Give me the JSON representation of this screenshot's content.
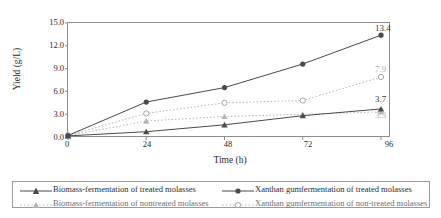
{
  "chart_data": {
    "type": "line",
    "title": "",
    "xlabel": "Time (h)",
    "ylabel": "Yield (g/L)",
    "x": [
      0,
      24,
      48,
      72,
      96
    ],
    "xticklabels": [
      "0",
      "24",
      "48",
      "72",
      "96"
    ],
    "yticklabels": [
      "0.0",
      "3.0",
      "6.0",
      "9.0",
      "12.0",
      "15.0"
    ],
    "ytickvalues": [
      0.0,
      3.0,
      6.0,
      9.0,
      12.0,
      15.0
    ],
    "xlim": [
      0,
      96
    ],
    "ylim": [
      0,
      15
    ],
    "grid": false,
    "legend_position": "bottom",
    "series": [
      {
        "name": "Biomass-fermentation of treated molasses",
        "values": [
          0.15,
          0.7,
          1.6,
          2.8,
          3.7
        ],
        "marker": "triangle-filled",
        "linestyle": "solid",
        "color": "#4a4a4a",
        "end_label": "3.7",
        "end_label_tone": "dark"
      },
      {
        "name": "Xanthan gumfermentation of treated molasses",
        "values": [
          0.2,
          4.6,
          6.5,
          9.6,
          13.4
        ],
        "marker": "circle-filled",
        "linestyle": "solid",
        "color": "#4a4a4a",
        "end_label": "13.4",
        "end_label_tone": "dark"
      },
      {
        "name": "Biomass-fermentation of nontreated molasses",
        "values": [
          0.15,
          2.1,
          2.7,
          3.0,
          3.3
        ],
        "marker": "triangle-shaded",
        "linestyle": "dotted",
        "color": "#b5b5b5",
        "end_label": "3.3",
        "end_label_tone": "light"
      },
      {
        "name": "Xanthan gumfermentation of non-treated molasses",
        "values": [
          0.2,
          3.1,
          4.5,
          4.8,
          7.9
        ],
        "marker": "circle-open",
        "linestyle": "dotted",
        "color": "#b5b5b5",
        "end_label": "7.9",
        "end_label_tone": "light"
      }
    ]
  },
  "axes": {
    "y_title": "Yield (g/L)",
    "x_title": "Time (h)",
    "y_ticks": [
      "0.0",
      "3.0",
      "6.0",
      "9.0",
      "12.0",
      "15.0"
    ],
    "x_ticks": [
      "0",
      "24",
      "48",
      "72",
      "96"
    ]
  },
  "labels": {
    "xanthan_treated_end": "13.4",
    "xanthan_nontreated_end": "7.9",
    "biomass_treated_end": "3.7",
    "biomass_nontreated_end": "3.3"
  },
  "legend": {
    "entries": [
      {
        "label": "Biomass-fermentation of treated molasses",
        "tone": "dark"
      },
      {
        "label": "Biomass-fermentation of nontreated molasses",
        "tone": "light"
      },
      {
        "label": "Xanthan gumfermentation of treated molasses",
        "tone": "dark"
      },
      {
        "label": "Xanthan gumfermentation of non-treated molasses",
        "tone": "light"
      }
    ]
  },
  "colors": {
    "dark_line": "#4a4a4a",
    "light_line": "#b5b5b5",
    "border": "#8e8e8e",
    "text": "#2b2b2b"
  }
}
